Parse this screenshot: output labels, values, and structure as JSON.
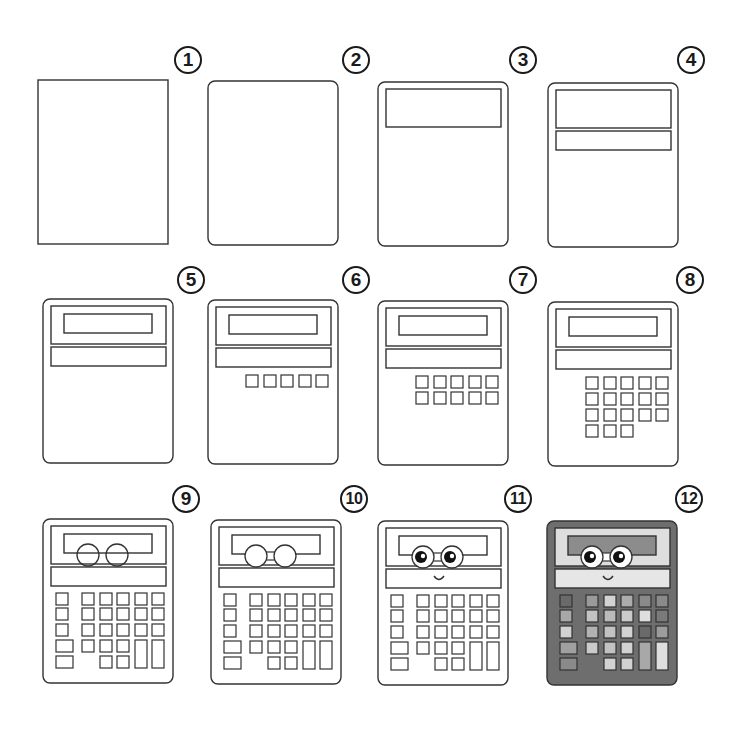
{
  "colors": {
    "line": "#333333",
    "body_final": "#6e6e6e",
    "frame_final": "#dedede",
    "screen_final": "#8c8c8c",
    "bar_final": "#e6e6e6"
  },
  "steps": [
    {
      "number": "1",
      "label": "Draw a rectangle",
      "x": 38,
      "y": 80,
      "badge": [
        174,
        46
      ]
    },
    {
      "number": "2",
      "label": "Round the corners",
      "x": 208,
      "y": 81,
      "badge": [
        342,
        46
      ]
    },
    {
      "number": "3",
      "label": "Add the screen frame",
      "x": 378,
      "y": 82,
      "badge": [
        509,
        46
      ]
    },
    {
      "number": "4",
      "label": "Add a bar below",
      "x": 548,
      "y": 83,
      "badge": [
        677,
        46
      ]
    },
    {
      "number": "5",
      "label": "Add inner display",
      "x": 43,
      "y": 299,
      "badge": [
        177,
        266
      ]
    },
    {
      "number": "6",
      "label": "Add first row of keys",
      "x": 208,
      "y": 300,
      "badge": [
        342,
        266
      ]
    },
    {
      "number": "7",
      "label": "Add second row of keys",
      "x": 378,
      "y": 301,
      "badge": [
        509,
        266
      ]
    },
    {
      "number": "8",
      "label": "Add more keys",
      "x": 548,
      "y": 302,
      "badge": [
        676,
        266
      ]
    },
    {
      "number": "9",
      "label": "Add side keys, large keys and glasses outline",
      "x": 43,
      "y": 519,
      "badge": [
        172,
        485
      ]
    },
    {
      "number": "10",
      "label": "Finish the glasses",
      "x": 211,
      "y": 520,
      "badge": [
        340,
        485
      ]
    },
    {
      "number": "11",
      "label": "Add eyes and a smile",
      "x": 378,
      "y": 521,
      "badge": [
        504,
        485
      ]
    },
    {
      "number": "12",
      "label": "Color it in",
      "x": 547,
      "y": 521,
      "badge": [
        675,
        485
      ]
    }
  ],
  "key_shades_final": {
    "left": [
      "#6a6a6a",
      "#a8a8a8",
      "#d2d2d2",
      "#a0a0a0",
      "#8a8a8a"
    ],
    "grid": [
      [
        "#9a9a9a",
        "#d2d2d2",
        "#acacac",
        "#8a8a8a",
        "#8a8a8a"
      ],
      [
        "#c2c2c2",
        "#bababa",
        "#cacaca",
        "#dedede",
        "#7a7a7a"
      ],
      [
        "#b2b2b2",
        "#c2c2c2",
        "#d2d2d2",
        "#6a6a6a",
        "#9c9c9c"
      ],
      [
        "#cacaca",
        "#c2c2c2",
        "#d2d2d2",
        "",
        ""
      ],
      [
        "",
        "#d2d2d2",
        "#d2d2d2",
        "",
        ""
      ]
    ],
    "tall": [
      "#a8a8a8",
      "#dedede"
    ]
  }
}
